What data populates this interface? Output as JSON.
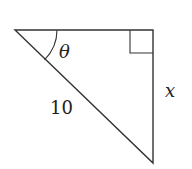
{
  "diagram": {
    "type": "right-triangle",
    "labels": {
      "angle": "θ",
      "hypotenuse": "10",
      "opposite_side": "x"
    },
    "colors": {
      "stroke": "#333333",
      "text": "#222222"
    }
  }
}
